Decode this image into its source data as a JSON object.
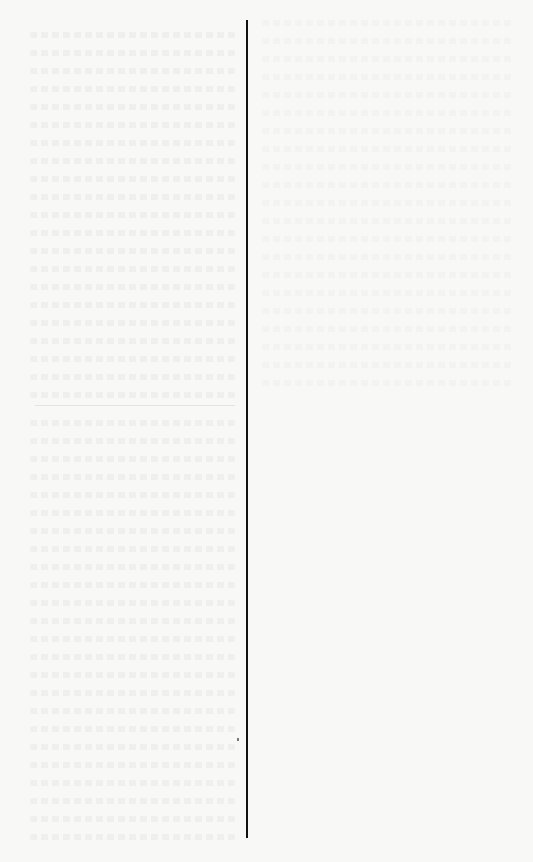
{
  "document": {
    "type": "scanned-page",
    "background_color": "#f8f8f6",
    "rule_color": "#111111",
    "content_note": "Blank page with illegible show-through text and a single vertical rule"
  }
}
